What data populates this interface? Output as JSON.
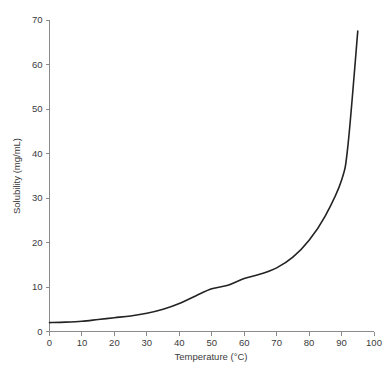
{
  "chart_data": {
    "type": "line",
    "title": "",
    "xlabel": "Temperature (°C)",
    "ylabel": "Solubility (mg/mL)",
    "xlim": [
      0,
      100
    ],
    "ylim": [
      0,
      70
    ],
    "grid": false,
    "legend": null,
    "xticks": [
      0,
      10,
      20,
      30,
      40,
      50,
      60,
      70,
      80,
      90,
      100
    ],
    "yticks": [
      0,
      10,
      20,
      30,
      40,
      50,
      60,
      70
    ],
    "xtick_labels": [
      "0",
      "10",
      "20",
      "30",
      "40",
      "50",
      "60",
      "70",
      "80",
      "90",
      "100"
    ],
    "ytick_labels": [
      "0",
      "10",
      "20",
      "30",
      "40",
      "50",
      "60",
      "70"
    ],
    "series": [
      {
        "name": "solubility",
        "color": "#232323",
        "x": [
          0,
          5,
          10,
          15,
          20,
          25,
          30,
          35,
          40,
          45,
          50,
          55,
          60,
          65,
          70,
          75,
          80,
          85,
          90,
          92,
          95
        ],
        "values": [
          2.0,
          2.1,
          2.3,
          2.7,
          3.1,
          3.5,
          4.1,
          5.0,
          6.3,
          8.0,
          9.6,
          10.4,
          11.9,
          12.9,
          14.3,
          16.7,
          20.5,
          26.0,
          34.0,
          42.0,
          67.5
        ]
      }
    ]
  },
  "axes": {
    "x_axis_name": "x-axis",
    "y_axis_name": "y-axis"
  }
}
